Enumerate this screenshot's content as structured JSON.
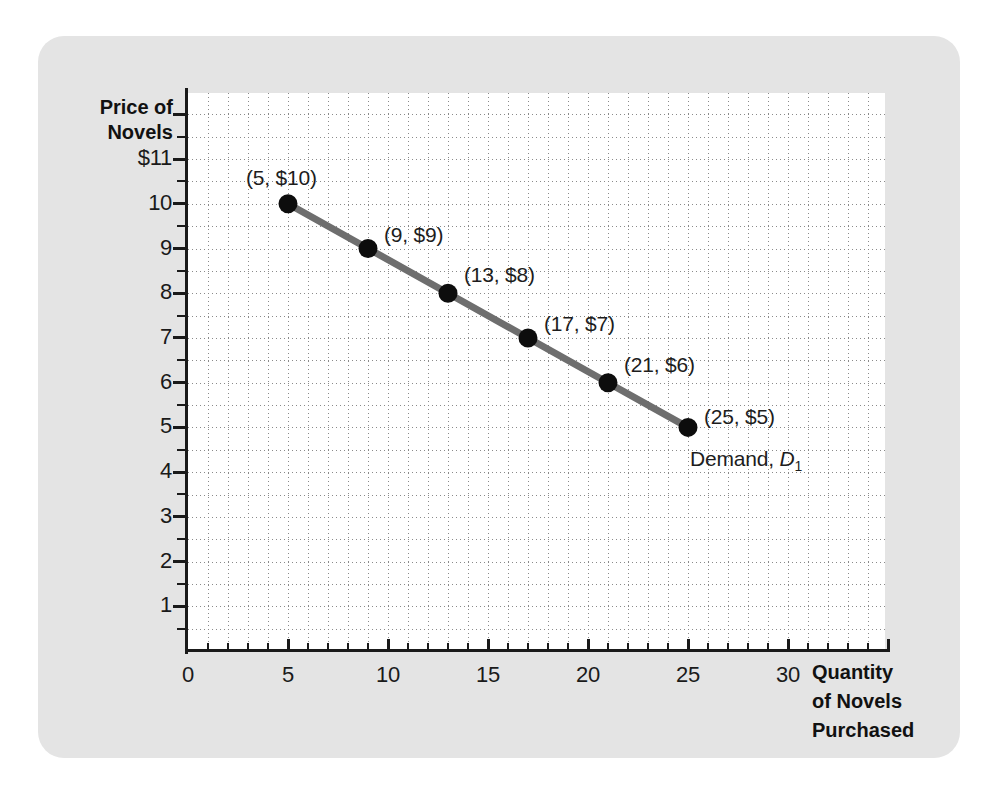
{
  "chart_data": {
    "type": "line",
    "title": "",
    "xlabel": "Quantity of Novels Purchased",
    "ylabel": "Price of Novels",
    "xlim": [
      0,
      33
    ],
    "ylim": [
      0,
      12
    ],
    "grid": true,
    "legend_position": "inline-annotation",
    "x_ticks": [
      0,
      5,
      10,
      15,
      20,
      25,
      30
    ],
    "x_tick_labels": [
      "0",
      "5",
      "10",
      "15",
      "20",
      "25",
      "30"
    ],
    "x_minor_tick_step": 1,
    "y_ticks": [
      1,
      2,
      3,
      4,
      5,
      6,
      7,
      8,
      9,
      10,
      11
    ],
    "y_tick_labels": [
      "1",
      "2",
      "3",
      "4",
      "5",
      "6",
      "7",
      "8",
      "9",
      "10",
      "$11"
    ],
    "y_minor_tick_step": 0.5,
    "series": [
      {
        "name": "Demand, D1",
        "color": "#6e6e6e",
        "marker_color": "#0d0d0d",
        "x": [
          5,
          9,
          13,
          17,
          21,
          25
        ],
        "values": [
          10,
          9,
          8,
          7,
          6,
          5
        ],
        "point_labels": [
          "(5, $10)",
          "(9, $9)",
          "(13, $8)",
          "(17, $7)",
          "(21, $6)",
          "(25, $5)"
        ]
      }
    ],
    "annotations": [
      {
        "text_prefix": "Demand, ",
        "text_symbol": "D",
        "text_subscript": "1"
      }
    ]
  },
  "axis_titles": {
    "y_line1": "Price of",
    "y_line2": "Novels",
    "x_line1": "Quantity",
    "x_line2": "of Novels",
    "x_line3": "Purchased"
  },
  "colors": {
    "card_background": "#e4e4e4",
    "plot_background": "#ffffff",
    "axis": "#1a1a1a",
    "grid": "#8a8a8a",
    "demand_line": "#6e6e6e",
    "marker": "#0d0d0d",
    "text": "#1a1a1a"
  }
}
